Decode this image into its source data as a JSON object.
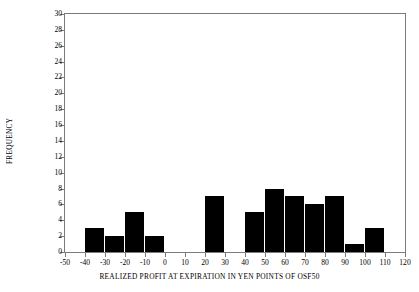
{
  "chart_data": {
    "type": "bar",
    "title": "",
    "xlabel": "REALIZED PROFIT AT EXPIRATION IN YEN POINTS OF OSF50",
    "ylabel": "FREQUENCY",
    "xlim": [
      -50,
      120
    ],
    "ylim": [
      0,
      30
    ],
    "xticks": [
      -50,
      -40,
      -30,
      -20,
      -10,
      0,
      10,
      20,
      30,
      40,
      50,
      60,
      70,
      80,
      90,
      100,
      110,
      120
    ],
    "xtick_labels": [
      "-50",
      "-40",
      "-30",
      "-20",
      "-10",
      "0",
      "10",
      "20",
      "30",
      "40",
      "50",
      "60",
      "70",
      "80",
      "90",
      "100",
      "110",
      "120"
    ],
    "yticks": [
      0,
      2,
      4,
      6,
      8,
      10,
      12,
      14,
      16,
      18,
      20,
      22,
      24,
      26,
      28,
      30
    ],
    "ytick_labels": [
      "0",
      "2",
      "4",
      "6",
      "8",
      "10",
      "12",
      "14",
      "16",
      "18",
      "20",
      "22",
      "24",
      "26",
      "28",
      "30"
    ],
    "grid": false,
    "legend": false,
    "bin_width": 10,
    "bar_color": "#000000",
    "axis_color": "#7b7b7b",
    "bins": [
      {
        "start": -50,
        "end": -40,
        "frequency": 0
      },
      {
        "start": -40,
        "end": -30,
        "frequency": 3
      },
      {
        "start": -30,
        "end": -20,
        "frequency": 2
      },
      {
        "start": -20,
        "end": -10,
        "frequency": 5
      },
      {
        "start": -10,
        "end": 0,
        "frequency": 2
      },
      {
        "start": 0,
        "end": 10,
        "frequency": 0
      },
      {
        "start": 10,
        "end": 20,
        "frequency": 0
      },
      {
        "start": 20,
        "end": 30,
        "frequency": 7
      },
      {
        "start": 30,
        "end": 40,
        "frequency": 0
      },
      {
        "start": 40,
        "end": 50,
        "frequency": 5
      },
      {
        "start": 50,
        "end": 60,
        "frequency": 8
      },
      {
        "start": 60,
        "end": 70,
        "frequency": 7
      },
      {
        "start": 70,
        "end": 80,
        "frequency": 6
      },
      {
        "start": 80,
        "end": 90,
        "frequency": 7
      },
      {
        "start": 90,
        "end": 100,
        "frequency": 1
      },
      {
        "start": 100,
        "end": 110,
        "frequency": 3
      },
      {
        "start": 110,
        "end": 120,
        "frequency": 0
      }
    ],
    "categories": [
      "-50",
      "-40",
      "-30",
      "-20",
      "-10",
      "0",
      "10",
      "20",
      "30",
      "40",
      "50",
      "60",
      "70",
      "80",
      "90",
      "100",
      "110"
    ],
    "values": [
      0,
      3,
      2,
      5,
      2,
      0,
      0,
      7,
      0,
      5,
      8,
      7,
      6,
      7,
      1,
      3,
      0
    ]
  }
}
